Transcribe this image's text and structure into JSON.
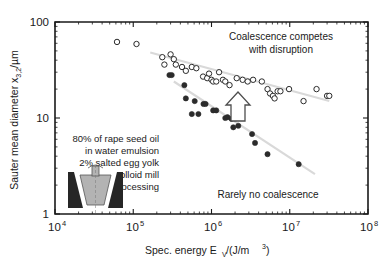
{
  "chart_data": {
    "type": "scatter",
    "title": "",
    "xlabel": "Spec. energy E_V/(J/m^3)",
    "ylabel": "Sauter mean diameter x_3,2/µm",
    "xscale": "log",
    "yscale": "log",
    "xlim": [
      10000,
      100000000
    ],
    "ylim": [
      1,
      100
    ],
    "grid": false,
    "legend": "none",
    "xticks": [
      "10⁴",
      "10⁵",
      "10⁶",
      "10⁷",
      "10⁸"
    ],
    "xtick_values": [
      10000,
      100000,
      1000000,
      10000000,
      100000000
    ],
    "yticks": [
      "1",
      "10",
      "100"
    ],
    "ytick_values": [
      1,
      10,
      100
    ],
    "series": [
      {
        "name": "open-circles-coalescence",
        "marker": "open-circle",
        "color": "#2b2b2b",
        "points": [
          [
            62000,
            62
          ],
          [
            110000,
            59
          ],
          [
            235000,
            43
          ],
          [
            250000,
            36
          ],
          [
            300000,
            46
          ],
          [
            330000,
            41
          ],
          [
            350000,
            36
          ],
          [
            420000,
            34
          ],
          [
            470000,
            31
          ],
          [
            560000,
            34
          ],
          [
            640000,
            33
          ],
          [
            780000,
            27
          ],
          [
            880000,
            26
          ],
          [
            930000,
            29
          ],
          [
            1000000,
            25
          ],
          [
            1050000,
            24
          ],
          [
            1150000,
            24
          ],
          [
            1250000,
            30
          ],
          [
            1400000,
            25
          ],
          [
            1500000,
            24
          ],
          [
            1700000,
            22
          ],
          [
            2100000,
            26
          ],
          [
            2500000,
            25
          ],
          [
            2900000,
            24
          ],
          [
            3400000,
            25
          ],
          [
            4400000,
            24
          ],
          [
            5200000,
            20
          ],
          [
            5600000,
            18
          ],
          [
            6100000,
            17
          ],
          [
            6400000,
            16
          ],
          [
            7000000,
            19
          ],
          [
            7600000,
            19
          ],
          [
            9800000,
            20
          ],
          [
            15000000.0,
            15
          ],
          [
            22000000.0,
            20
          ],
          [
            30000000.0,
            17
          ],
          [
            32000000.0,
            17
          ]
        ]
      },
      {
        "name": "filled-circles-no-coalescence",
        "marker": "filled-circle",
        "color": "#2b2b2b",
        "points": [
          [
            290000,
            28
          ],
          [
            310000,
            28
          ],
          [
            450000,
            22
          ],
          [
            470000,
            16
          ],
          [
            560000,
            11
          ],
          [
            610000,
            15
          ],
          [
            680000,
            11
          ],
          [
            790000,
            14
          ],
          [
            840000,
            14
          ],
          [
            1050000,
            12
          ],
          [
            1150000,
            12
          ],
          [
            1500000,
            10
          ],
          [
            1600000,
            10.2
          ],
          [
            1800000,
            9.8
          ],
          [
            1900000,
            8
          ],
          [
            2000000,
            9.9
          ],
          [
            2100000,
            10
          ],
          [
            2200000,
            8.3
          ],
          [
            2400000,
            10
          ],
          [
            3300000,
            6.8
          ],
          [
            3600000,
            5.5
          ],
          [
            5200000,
            4.2
          ],
          [
            13000000.0,
            3.3
          ]
        ]
      }
    ],
    "trendlines": [
      {
        "name": "upper-trend",
        "color": "#d9d9d9",
        "from": [
          165000,
          48
        ],
        "to": [
          32000000.0,
          15
        ]
      },
      {
        "name": "lower-trend",
        "color": "#d9d9d9",
        "from": [
          330000,
          24
        ],
        "to": [
          21000000.0,
          2.6
        ]
      }
    ],
    "annotations": [
      {
        "name": "coalescence-competes-annotation",
        "lines": [
          "Coalescence competes",
          "with disruption"
        ],
        "x": 280,
        "y": 40
      },
      {
        "name": "rarely-no-coalescence-annotation",
        "lines": [
          "Rarely no coalescence"
        ],
        "x": 268,
        "y": 196
      },
      {
        "name": "up-arrow-annotation",
        "shape": "hollow-up-arrow",
        "x": 238,
        "y": 107
      }
    ]
  },
  "axes": {
    "y_label_main": "Sauter mean diameter x",
    "y_label_sub": "3,2",
    "y_label_unit": "/µm",
    "x_label_part1": "Spec. energy E",
    "x_label_sub": "V",
    "x_label_part2": "/(J/m",
    "x_label_exp": "3",
    "x_label_part3": ")",
    "x_ticks": [
      {
        "base": "10",
        "exp": "4"
      },
      {
        "base": "10",
        "exp": "5"
      },
      {
        "base": "10",
        "exp": "6"
      },
      {
        "base": "10",
        "exp": "7"
      },
      {
        "base": "10",
        "exp": "8"
      }
    ],
    "y_ticks": [
      "100",
      "10",
      "1"
    ]
  },
  "annotations": {
    "top_right_line1": "Coalescence competes",
    "top_right_line2": "with disruption",
    "bottom_right": "Rarely no coalescence"
  },
  "inset": {
    "line1": "80% of rape seed oil",
    "line2": "in water emulsion",
    "line3": "2% salted egg yolk",
    "line4": "colloid mill",
    "line5": "processing",
    "icon_name": "colloid-mill-icon"
  },
  "colors": {
    "axis": "#1a1a1a",
    "trendline": "#d9d9d9",
    "marker": "#2b2b2b",
    "background": "#ffffff",
    "icon_dark": "#262626",
    "icon_gray": "#b3b3b3"
  }
}
